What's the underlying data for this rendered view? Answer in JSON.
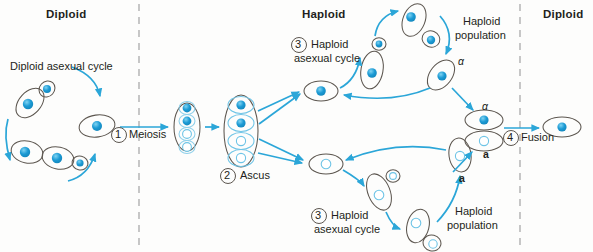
{
  "figure": {
    "colors": {
      "accent": "#2ba6d8",
      "nucleus_filled": "#1b9ad4",
      "nucleus_open": "#ffffff",
      "cell_outline": "#5c564f",
      "text": "#231f20",
      "divider": "#9b9b9b",
      "background": "#fdfdfc"
    }
  },
  "headers": [
    {
      "id": "hdr-diploid-left",
      "label": "Diploid",
      "x": 46,
      "y": 8
    },
    {
      "id": "hdr-haploid",
      "label": "Haploid",
      "x": 302,
      "y": 8
    },
    {
      "id": "hdr-diploid-right",
      "label": "Diploid",
      "x": 543,
      "y": 8
    }
  ],
  "dividers": [
    {
      "id": "divider-left",
      "x": 139
    },
    {
      "id": "divider-right",
      "x": 520
    }
  ],
  "steps": [
    {
      "id": "step-1",
      "number": "1",
      "label": "Meiosis",
      "cx": 119,
      "cy": 135
    },
    {
      "id": "step-2",
      "number": "2",
      "label": "Ascus",
      "cx": 228,
      "cy": 176
    },
    {
      "id": "step-3-top",
      "number": "3",
      "label_line1": "Haploid",
      "label_line2": "asexual cycle",
      "cx": 299,
      "cy": 45
    },
    {
      "id": "step-3-bottom",
      "number": "3",
      "label_line1": "Haploid",
      "label_line2": "asexual cycle",
      "cx": 319,
      "cy": 216
    },
    {
      "id": "step-4",
      "number": "4",
      "label": "Fusion",
      "cx": 511,
      "cy": 138
    }
  ],
  "captions": [
    {
      "id": "caption-diploid-asexual-cycle",
      "text": "Diploid asexual cycle",
      "x": 10,
      "y": 66
    },
    {
      "id": "caption-haploid-population-top",
      "line1": "Haploid",
      "line2": "population",
      "x": 463,
      "y": 18
    },
    {
      "id": "caption-haploid-population-bottom",
      "line1": "Haploid",
      "line2": "population",
      "x": 455,
      "y": 208
    }
  ],
  "mating_type_labels": [
    {
      "id": "mating-alpha-upper",
      "text": "α",
      "x": 458,
      "y": 62,
      "style": "italic"
    },
    {
      "id": "mating-alpha-fusion",
      "text": "α",
      "x": 482,
      "y": 96,
      "style": "italic"
    },
    {
      "id": "mating-a-fusion",
      "text": "a",
      "x": 483,
      "y": 155,
      "style": "bold"
    },
    {
      "id": "mating-a-lower",
      "text": "a",
      "x": 459,
      "y": 175,
      "style": "bold"
    }
  ],
  "cells": {
    "diploid_cycle": [
      {
        "id": "diploid-cell-top",
        "cx": 30,
        "cy": 103,
        "rx": 17,
        "ry": 11,
        "rot": -48,
        "nucleus": "filled"
      },
      {
        "id": "diploid-bud-top",
        "cx": 47,
        "cy": 89,
        "rx": 8,
        "ry": 7,
        "rot": -48,
        "nucleus": "filled"
      },
      {
        "id": "diploid-cell-bottom",
        "cx": 27,
        "cy": 152,
        "rx": 16,
        "ry": 11,
        "rot": 12,
        "nucleus": "filled"
      },
      {
        "id": "diploid-cell-bottom2",
        "cx": 58,
        "cy": 158,
        "rx": 16,
        "ry": 11,
        "rot": 12,
        "nucleus": "filled"
      },
      {
        "id": "diploid-bud-bottom",
        "cx": 80,
        "cy": 163,
        "rx": 8,
        "ry": 7,
        "rot": 12,
        "nucleus": "filled"
      },
      {
        "id": "diploid-cell-right",
        "cx": 97,
        "cy": 126,
        "rx": 18,
        "ry": 11,
        "rot": -8,
        "nucleus": "filled"
      }
    ],
    "meiotic_cell": {
      "id": "meiotic-cell",
      "cx": 187,
      "cy": 127,
      "rx": 13,
      "ry": 24,
      "nuclei": [
        "filled",
        "filled",
        "open",
        "open"
      ]
    },
    "ascus": {
      "id": "ascus",
      "cx": 241,
      "cy": 131,
      "rx": 17,
      "ry": 36,
      "spores": [
        {
          "id": "ascospore-1",
          "nucleus": "filled"
        },
        {
          "id": "ascospore-2",
          "nucleus": "filled"
        },
        {
          "id": "ascospore-3",
          "nucleus": "open"
        },
        {
          "id": "ascospore-4",
          "nucleus": "open"
        }
      ]
    },
    "haploid_top": [
      {
        "id": "haploid-top-hub",
        "cx": 321,
        "cy": 91,
        "rx": 17,
        "ry": 10,
        "rot": 0,
        "nucleus": "filled"
      },
      {
        "id": "haploid-top-budding",
        "cx": 372,
        "cy": 70,
        "rx": 11,
        "ry": 19,
        "rot": 10,
        "nucleus": "filled"
      },
      {
        "id": "haploid-top-bud",
        "cx": 379,
        "cy": 44,
        "rx": 7,
        "ry": 6,
        "rot": 0,
        "nucleus": "filled"
      },
      {
        "id": "haploid-top-pair-a",
        "cx": 414,
        "cy": 20,
        "rx": 11,
        "ry": 17,
        "rot": 22,
        "nucleus": "filled"
      },
      {
        "id": "haploid-top-pair-b",
        "cx": 431,
        "cy": 39,
        "rx": 9,
        "ry": 8,
        "rot": 22,
        "nucleus": "filled"
      },
      {
        "id": "haploid-top-alpha",
        "cx": 441,
        "cy": 75,
        "rx": 11,
        "ry": 17,
        "rot": 38,
        "nucleus": "filled"
      }
    ],
    "haploid_bottom": [
      {
        "id": "haploid-bot-hub",
        "cx": 326,
        "cy": 164,
        "rx": 17,
        "ry": 10,
        "rot": 0,
        "nucleus": "open"
      },
      {
        "id": "haploid-bot-budding",
        "cx": 379,
        "cy": 192,
        "rx": 11,
        "ry": 19,
        "rot": -22,
        "nucleus": "open"
      },
      {
        "id": "haploid-bot-bud",
        "cx": 393,
        "cy": 176,
        "rx": 7,
        "ry": 6,
        "rot": 0,
        "nucleus": "open"
      },
      {
        "id": "haploid-bot-pair-a",
        "cx": 418,
        "cy": 226,
        "rx": 11,
        "ry": 17,
        "rot": 14,
        "nucleus": "open"
      },
      {
        "id": "haploid-bot-pair-b",
        "cx": 432,
        "cy": 243,
        "rx": 9,
        "ry": 8,
        "rot": 14,
        "nucleus": "open"
      },
      {
        "id": "haploid-bot-a",
        "cx": 460,
        "cy": 155,
        "rx": 11,
        "ry": 17,
        "rot": -8,
        "nucleus": "open"
      }
    ],
    "fusion": [
      {
        "id": "fusion-cell-alpha",
        "cx": 484,
        "cy": 120,
        "rx": 19,
        "ry": 10,
        "rot": 0,
        "nucleus": "filled"
      },
      {
        "id": "fusion-cell-a",
        "cx": 484,
        "cy": 141,
        "rx": 19,
        "ry": 10,
        "rot": 0,
        "nucleus": "open"
      }
    ],
    "zygote": {
      "id": "zygote-cell",
      "cx": 562,
      "cy": 127,
      "rx": 19,
      "ry": 10,
      "rot": 0,
      "nucleus": "filled"
    }
  },
  "arrows": [
    {
      "id": "arrow-meiosis",
      "from": "diploid-cell-right",
      "to": "meiotic-cell"
    },
    {
      "id": "arrow-to-ascus",
      "from": "meiotic-cell",
      "to": "ascus"
    },
    {
      "id": "arrow-ascus-spore-1",
      "from": "ascus",
      "to": "haploid-top-hub"
    },
    {
      "id": "arrow-ascus-spore-2",
      "from": "ascus",
      "to": "haploid-top-hub"
    },
    {
      "id": "arrow-ascus-spore-3",
      "from": "ascus",
      "to": "haploid-bot-hub"
    },
    {
      "id": "arrow-ascus-spore-4",
      "from": "ascus",
      "to": "haploid-bot-hub"
    },
    {
      "id": "arrow-fusion",
      "from": "fusion",
      "to": "zygote-cell"
    }
  ]
}
